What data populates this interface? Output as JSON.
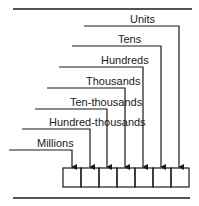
{
  "diagram": {
    "type": "place-value",
    "colors": {
      "ink": "#1a1a1a",
      "background": "#ffffff"
    },
    "places": [
      {
        "label": "Units",
        "line_y": 26,
        "line_x0": 84,
        "arrow_x": 179,
        "label_x": 130
      },
      {
        "label": "Tens",
        "line_y": 46,
        "line_x0": 72,
        "arrow_x": 161,
        "label_x": 118
      },
      {
        "label": "Hundreds",
        "line_y": 67,
        "line_x0": 59,
        "arrow_x": 143,
        "label_x": 101
      },
      {
        "label": "Thousands",
        "line_y": 88,
        "line_x0": 47,
        "arrow_x": 125,
        "label_x": 86
      },
      {
        "label": "Ten-thousands",
        "line_y": 109,
        "line_x0": 35,
        "arrow_x": 107,
        "label_x": 70
      },
      {
        "label": "Hundred-thousands",
        "line_y": 129,
        "line_x0": 22,
        "arrow_x": 90,
        "label_x": 49
      },
      {
        "label": "Millions",
        "line_y": 150,
        "line_x0": 9,
        "arrow_x": 72,
        "label_x": 37
      }
    ],
    "box_count": 7
  }
}
